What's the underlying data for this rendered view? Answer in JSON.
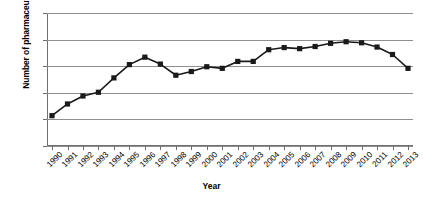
{
  "chart_data": {
    "type": "line",
    "title": "",
    "xlabel": "Year",
    "ylabel": "Number of pharmaceutical firms",
    "categories": [
      "1990",
      "1991",
      "1992",
      "1993",
      "1994",
      "1995",
      "1996",
      "1997",
      "1998",
      "1999",
      "2000",
      "2001",
      "2002",
      "2003",
      "2004",
      "2005",
      "2006",
      "2007",
      "2008",
      "2009",
      "2010",
      "2011",
      "2012",
      "2013"
    ],
    "values": [
      57,
      79,
      94,
      101,
      128,
      153,
      167,
      154,
      133,
      140,
      149,
      146,
      159,
      159,
      181,
      185,
      183,
      187,
      193,
      196,
      194,
      186,
      172,
      146
    ],
    "series": [
      {
        "name": "Number of pharmaceutical firms",
        "values": [
          57,
          79,
          94,
          101,
          128,
          153,
          167,
          154,
          133,
          140,
          149,
          146,
          159,
          159,
          181,
          185,
          183,
          187,
          193,
          196,
          194,
          186,
          172,
          146
        ]
      }
    ],
    "yticks": [
      0,
      50,
      100,
      150,
      200,
      250
    ],
    "ylim": [
      0,
      250
    ],
    "xlim": [
      "1990",
      "2013"
    ],
    "grid": true,
    "legend": false,
    "marker": "square",
    "line_color": "#1a1a1a",
    "marker_color": "#1a1a1a",
    "grid_color": "#8f8f8f",
    "background": "#ffffff"
  }
}
